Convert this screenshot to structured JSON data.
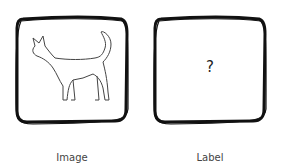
{
  "panels": [
    {
      "id": "image",
      "caption": "Image",
      "content": "dog-sketch"
    },
    {
      "id": "label",
      "caption": "Label",
      "content": "?"
    }
  ]
}
